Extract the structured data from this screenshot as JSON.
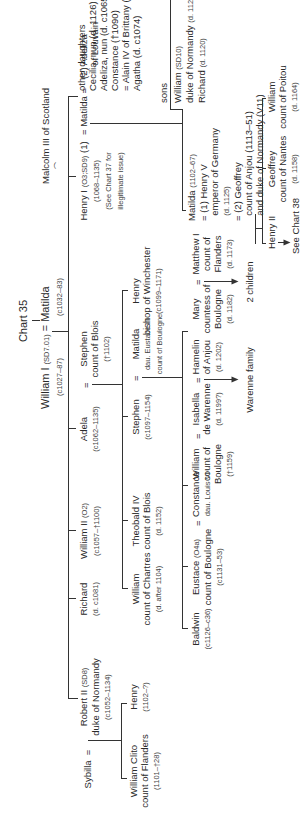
{
  "chart": {
    "title": "Chart 35",
    "root": {
      "name": "William I",
      "ref": "(SD7.01)",
      "dates": "(c1027–87)",
      "spouse_eq": "=",
      "spouse_name": "Matilda",
      "spouse_dates": "(c1032–83)"
    },
    "children": {
      "robert": {
        "wife": "Sybilla",
        "eq": "=",
        "name": "Robert II",
        "ref": "(SD8)",
        "title": "duke of Normandy",
        "dates": "(c1052–1134)"
      },
      "richard": {
        "name": "Richard",
        "dates": "(d. c1081)"
      },
      "william2": {
        "name": "William II",
        "ref": "(O2)",
        "dates": "(c1057–†1100)"
      },
      "adela": {
        "name": "Adela",
        "dates": "(c1062–1135)",
        "eq": "=",
        "spouse_name": "Stephen",
        "spouse_title": "count of Blois",
        "spouse_dates": "(†1102)"
      },
      "henry1": {
        "name": "Henry I",
        "ref": "(O3;SD9)",
        "marr": "(1)",
        "dates": "(1068–1135)",
        "note1": "(See Chart 37 for",
        "note2": "illegitimate issue)",
        "eq1": "=",
        "wife1": "Matilda",
        "eq2": "=",
        "wife2": "(2) Adeliza",
        "wife2b": "of Louvain"
      },
      "malcolm": "Malcolm III of Scotland",
      "daughters": {
        "header": "other daughters",
        "items": [
          "Cecilia, nun (d. 1126)",
          "Adeliza, nun (d. c1065)",
          "Constance (†1090)",
          "= Alain IV of Brittany (SA40)",
          "Agatha (d. c1074)"
        ]
      }
    },
    "grandchildren": {
      "william_clito": {
        "name": "William Clito",
        "title": "count of Flanders",
        "dates": "(1101–†28)"
      },
      "henry_r": {
        "name": "Henry",
        "dates": "(1102–?)"
      },
      "william_chartres": {
        "name": "William",
        "title": "count of Chartres",
        "dates": "(d. after 1104)"
      },
      "theobald": {
        "name": "Theobald IV",
        "title": "count of Blois",
        "dates": "(d. 1152)"
      },
      "stephen": {
        "name": "Stephen",
        "dates": "(c1097–1154)",
        "eq": "=",
        "spouse_name": "Matilda",
        "spouse_l1": "dau. Eustace III",
        "spouse_l2": "count of Boulogne"
      },
      "henry_winchester": {
        "name": "Henry",
        "title": "bishop of Winchester",
        "dates": "(c1099–1171)"
      },
      "matilda_emp": {
        "name": "Matilda",
        "dates": "(1102–67)",
        "h1a": "= (1) Henry V",
        "h1b": "emperor of Germany",
        "h1c": "(d. 1125)",
        "h2a": "= (2) Geoffrey",
        "h2b": "count of Anjou (1113–51)",
        "h2c": "and duke of Normandy (V11)"
      },
      "sons": {
        "header": "sons",
        "s1a": "William",
        "s1ref": "(SD10)",
        "s1b": "duke of Normandy",
        "s1d": "(d. 1120)",
        "s2": "Richard",
        "s2d": "(d. 1120)"
      }
    },
    "great_grandchildren": {
      "baldwin": {
        "name": "Baldwin",
        "dates": "(c1126–c36)"
      },
      "eustace": {
        "name": "Eustace",
        "ref": "(O4a)",
        "title": "count of Boulogne",
        "dates": "(c1131–53)",
        "eq": "=",
        "spouse_name": "Constance",
        "spouse_l1": "dau. Louis VI"
      },
      "william_boulogne": {
        "name": "William",
        "title1": "count of",
        "title2": "Boulogne",
        "dates": "(†1159)",
        "eq": "=",
        "spouse_name": "Isabella",
        "spouse_l1": "de Warenne",
        "spouse_d": "(d. 1199?)",
        "eq2": "=",
        "spouse2_name": "Hamelin",
        "spouse2_l1": "of Anjou",
        "spouse2_d": "(d. 1202)",
        "issue": "Warenne family"
      },
      "mary": {
        "name": "Mary",
        "title1": "countess of",
        "title2": "Boulogne",
        "dates": "(d. 1182)",
        "eq": "=",
        "spouse_name": "Matthew I",
        "spouse_l1": "count of",
        "spouse_l2": "Flanders",
        "spouse_d": "(d. 1173)",
        "issue": "2 children"
      },
      "henry2": {
        "name": "Henry II",
        "ref": "See Chart 38"
      },
      "geoffrey": {
        "name": "Geoffrey",
        "title": "count of Nantes",
        "dates": "(d. 1158)"
      },
      "william_poitou": {
        "name": "William",
        "title": "count of Poitou",
        "dates": "(d. 1164)"
      }
    }
  }
}
